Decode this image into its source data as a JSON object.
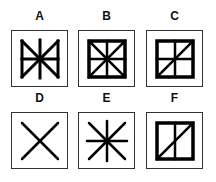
{
  "puzzle": {
    "options": [
      {
        "label": "A",
        "figure": "bowtie-with-cross",
        "description": "Two triangles meeting at center (bowtie) with vertical and horizontal center lines"
      },
      {
        "label": "B",
        "figure": "square-with-cross-and-diagonals",
        "description": "Bold square with vertical, horizontal and both diagonal lines"
      },
      {
        "label": "C",
        "figure": "square-with-cross-and-one-diagonal",
        "description": "Bold square with vertical, horizontal and one diagonal line"
      },
      {
        "label": "D",
        "figure": "x-cross",
        "description": "Two diagonal lines forming an X"
      },
      {
        "label": "E",
        "figure": "eight-point-star",
        "description": "Vertical, horizontal and both diagonal lines crossing at center"
      },
      {
        "label": "F",
        "figure": "rectangle-with-vertical-and-diagonal",
        "description": "Bold rectangle with vertical center line and one diagonal"
      }
    ]
  },
  "colors": {
    "stroke": "#000000",
    "frame": "#333333",
    "background": "#ffffff"
  }
}
